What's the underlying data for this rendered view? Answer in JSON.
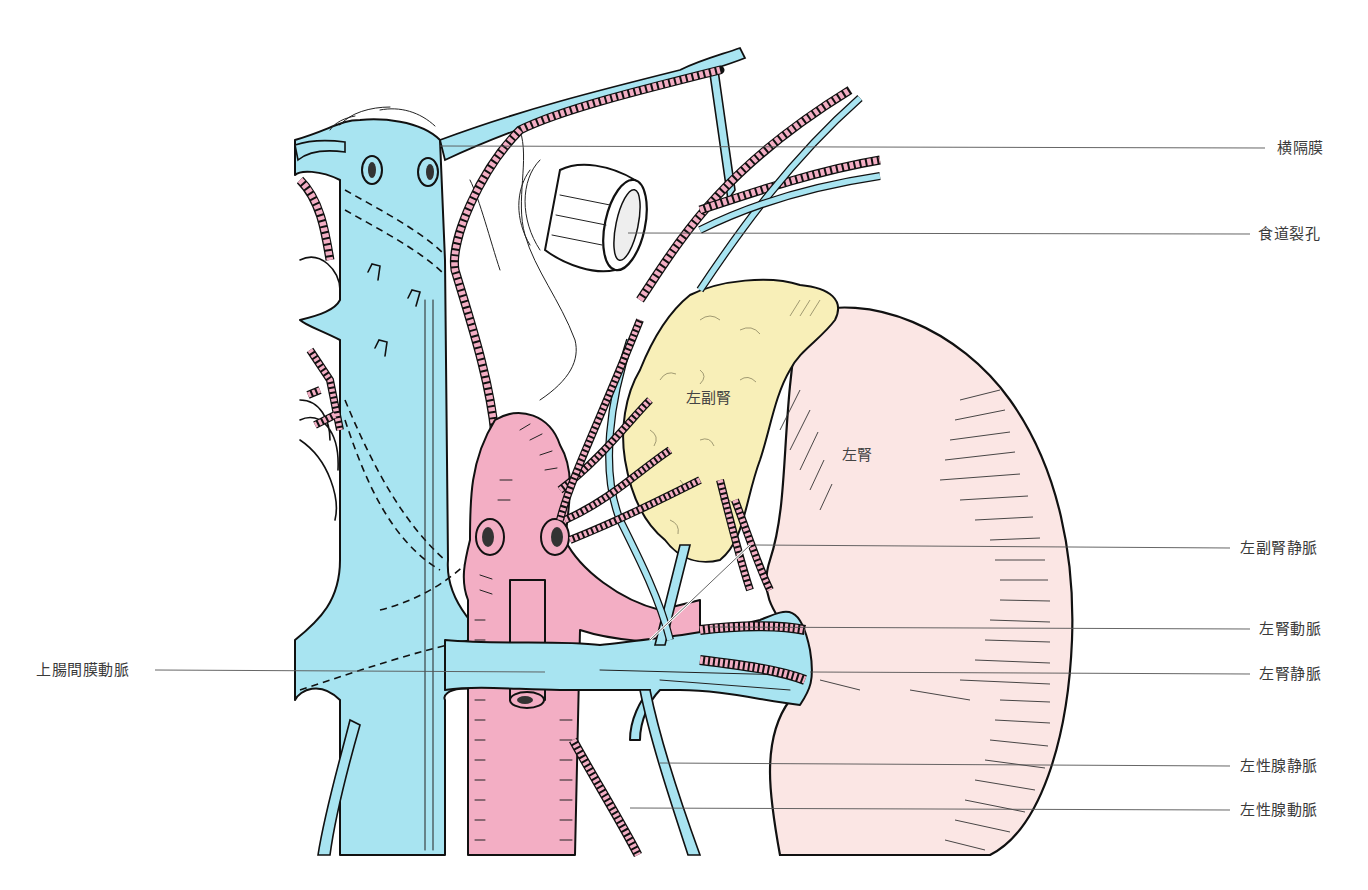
{
  "figure": {
    "colors": {
      "vein": "#a8e4f1",
      "artery": "#f3aec4",
      "adrenal": "#f8efb8",
      "kidney": "#fbe6e4",
      "outline": "#111111",
      "label_text": "#3a3a3a"
    }
  },
  "organ_labels": {
    "adrenal": "左副腎",
    "kidney": "左腎"
  },
  "labels_right": [
    {
      "id": "diaphragm",
      "text": "横隔膜"
    },
    {
      "id": "esophageal-hiatus",
      "text": "食道裂孔"
    },
    {
      "id": "left-adrenal-vein",
      "text": "左副腎静脈"
    },
    {
      "id": "left-renal-artery",
      "text": "左腎動脈"
    },
    {
      "id": "left-renal-vein",
      "text": "左腎静脈"
    },
    {
      "id": "left-gonadal-vein",
      "text": "左性腺静脈"
    },
    {
      "id": "left-gonadal-artery",
      "text": "左性腺動脈"
    }
  ],
  "labels_left": [
    {
      "id": "superior-mesenteric-artery",
      "text": "上腸間膜動脈"
    }
  ]
}
